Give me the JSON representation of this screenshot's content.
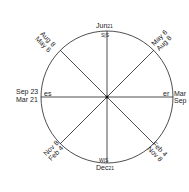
{
  "diagram": {
    "type": "sun-position-circle",
    "top": {
      "date": "Jun",
      "day": "21",
      "marks": "S|S"
    },
    "bottom": {
      "date": "Dec",
      "day": "21",
      "marks": "W|S"
    },
    "left": {
      "line1": "Sep 23",
      "line2": "Mar 21",
      "mark": "es"
    },
    "right": {
      "line1": "Mar",
      "line2": "Sep",
      "mark": "er"
    },
    "upper_left": {
      "line1": "Aug 8",
      "line2": "May 6"
    },
    "upper_right": {
      "line1": "May 6",
      "line2": "Aug 8"
    },
    "lower_left": {
      "line1": "Nov 8",
      "line2": "Feb 4"
    },
    "lower_right": {
      "line1": "Feb 4",
      "line2": "Nov 8"
    },
    "colors": {
      "line": "#222222",
      "background": "#ffffff"
    }
  }
}
